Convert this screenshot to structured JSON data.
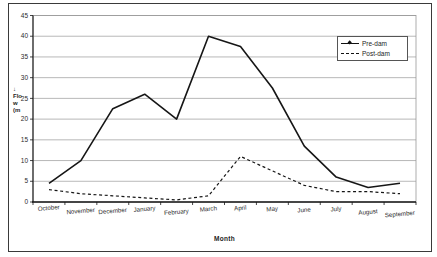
{
  "figure": {
    "ylabel_lines": [
      "↓",
      "Flo",
      "w",
      "(m"
    ],
    "xlabel": "Month"
  },
  "chart_data": {
    "type": "line",
    "title": "",
    "xlabel": "Month",
    "ylabel": "Flow (m",
    "categories": [
      "October",
      "November",
      "December",
      "January",
      "February",
      "March",
      "April",
      "May",
      "June",
      "July",
      "August",
      "September"
    ],
    "series": [
      {
        "name": "Pre-dam",
        "style": "solid",
        "values": [
          4.5,
          10,
          22.5,
          26,
          20,
          40,
          37.5,
          27.5,
          13.5,
          6,
          3.5,
          4.5
        ]
      },
      {
        "name": "Post-dam",
        "style": "dashed",
        "values": [
          3,
          2,
          1.5,
          1,
          0.5,
          1.5,
          11,
          7.5,
          4,
          2.5,
          2.5,
          2
        ]
      }
    ],
    "ylim": [
      0,
      45
    ],
    "yticks": [
      0,
      5,
      10,
      15,
      20,
      25,
      30,
      35,
      40,
      45
    ],
    "grid": true,
    "legend_position": "upper-right",
    "colors": {
      "line": "#161616",
      "grid": "#9a9a9a",
      "text": "#2c2c2c",
      "background": "#ffffff"
    }
  }
}
